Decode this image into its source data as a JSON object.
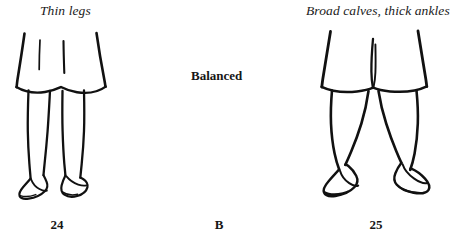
{
  "figure": {
    "style": "black-and-white ink line drawing",
    "background_color": "#ffffff",
    "ink_color": "#111111"
  },
  "labels": {
    "left_top": "Thin legs",
    "center_top": "Balanced",
    "right_top": "Broad calves, thick ankles"
  },
  "numbers": {
    "left": "24",
    "center": "B",
    "right": "25"
  },
  "panels": [
    {
      "id": "left-figure",
      "number": "24",
      "caption": "Thin legs",
      "description": "Lower body of a woman in an A-line pleated skirt with slender, straight, thin legs and pointed high-heel pumps"
    },
    {
      "id": "center-figure",
      "number": "B",
      "caption": "Balanced",
      "description": "Text-only middle column marking the balanced reference option"
    },
    {
      "id": "right-figure",
      "number": "25",
      "caption": "Broad calves, thick ankles",
      "description": "Lower body of a woman in an A-line skirt with bowed legs, broad calves, thick ankles and outward-splayed pointed pumps"
    }
  ]
}
